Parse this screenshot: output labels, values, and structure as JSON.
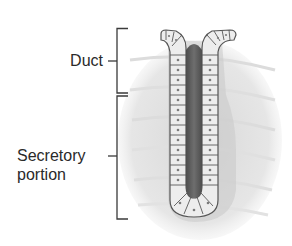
{
  "figure": {
    "type": "simple tubular gland illustration",
    "labels": {
      "duct": "Duct",
      "secretory_line1": "Secretory",
      "secretory_line2": "portion"
    },
    "brackets": [
      {
        "name": "duct",
        "top": 28,
        "bottom": 93,
        "tick_y": 61
      },
      {
        "name": "secretory-portion",
        "top": 96,
        "bottom": 219,
        "tick_y": 156
      }
    ],
    "colors": {
      "bracket": "#3a3a3a",
      "text": "#2a2a2a",
      "tissue_background": "#e4e4e4",
      "cell_fill": "#ececec",
      "cell_border": "#5a5a5a",
      "lumen": "#5e5e5e",
      "nucleus": "#7a7a7a"
    }
  }
}
